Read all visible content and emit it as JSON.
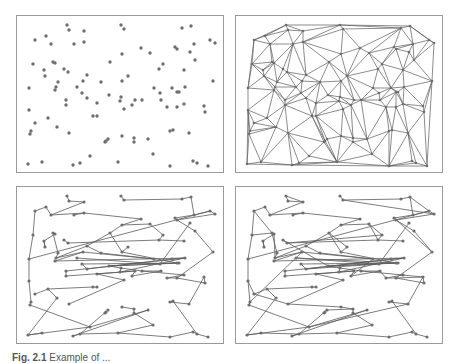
{
  "figure": {
    "caption_label": "Fig. 2.1",
    "caption_text": "Example of ...",
    "dot_color": "#6e6e6e",
    "edge_color": "#5a5a5a",
    "border_color": "#9a9a9a"
  },
  "panels": [
    {
      "id": "points",
      "title": "Random point set"
    },
    {
      "id": "delaunay",
      "title": "Delaunay triangulation"
    },
    {
      "id": "mst",
      "title": "Minimum spanning tree"
    },
    {
      "id": "graph",
      "title": "Sparse proximity graph"
    }
  ],
  "points": [
    [
      50,
      9
    ],
    [
      52,
      14
    ],
    [
      104,
      9
    ],
    [
      107,
      13
    ],
    [
      67,
      15
    ],
    [
      165,
      12
    ],
    [
      174,
      10
    ],
    [
      18,
      24
    ],
    [
      29,
      20
    ],
    [
      34,
      28
    ],
    [
      57,
      28
    ],
    [
      67,
      26
    ],
    [
      193,
      24
    ],
    [
      198,
      27
    ],
    [
      105,
      38
    ],
    [
      124,
      32
    ],
    [
      133,
      37
    ],
    [
      158,
      31
    ],
    [
      160,
      33
    ],
    [
      177,
      28
    ],
    [
      173,
      36
    ],
    [
      16,
      48
    ],
    [
      36,
      46
    ],
    [
      38,
      47
    ],
    [
      27,
      54
    ],
    [
      28,
      60
    ],
    [
      47,
      53
    ],
    [
      51,
      56
    ],
    [
      178,
      44
    ],
    [
      146,
      48
    ],
    [
      142,
      53
    ],
    [
      167,
      54
    ],
    [
      93,
      46
    ],
    [
      70,
      59
    ],
    [
      12,
      72
    ],
    [
      41,
      66
    ],
    [
      39,
      71
    ],
    [
      38,
      74
    ],
    [
      66,
      65
    ],
    [
      60,
      71
    ],
    [
      105,
      65
    ],
    [
      111,
      60
    ],
    [
      84,
      66
    ],
    [
      196,
      65
    ],
    [
      137,
      72
    ],
    [
      143,
      77
    ],
    [
      168,
      71
    ],
    [
      155,
      72
    ],
    [
      160,
      76
    ],
    [
      162,
      76
    ],
    [
      92,
      79
    ],
    [
      65,
      77
    ],
    [
      70,
      82
    ],
    [
      104,
      81
    ],
    [
      103,
      85
    ],
    [
      49,
      84
    ],
    [
      49,
      89
    ],
    [
      144,
      84
    ],
    [
      80,
      87
    ],
    [
      118,
      84
    ],
    [
      115,
      89
    ],
    [
      125,
      84
    ],
    [
      107,
      93
    ],
    [
      167,
      88
    ],
    [
      150,
      91
    ],
    [
      160,
      91
    ],
    [
      187,
      90
    ],
    [
      188,
      96
    ],
    [
      12,
      94
    ],
    [
      76,
      100
    ],
    [
      80,
      100
    ],
    [
      31,
      102
    ],
    [
      18,
      107
    ],
    [
      40,
      111
    ],
    [
      14,
      115
    ],
    [
      13,
      118
    ],
    [
      52,
      117
    ],
    [
      153,
      115
    ],
    [
      156,
      114
    ],
    [
      172,
      117
    ],
    [
      89,
      125
    ],
    [
      88,
      126
    ],
    [
      91,
      123
    ],
    [
      105,
      120
    ],
    [
      117,
      122
    ],
    [
      117,
      126
    ],
    [
      131,
      123
    ],
    [
      136,
      138
    ],
    [
      73,
      140
    ],
    [
      11,
      148
    ],
    [
      25,
      146
    ],
    [
      56,
      149
    ],
    [
      63,
      147
    ],
    [
      101,
      146
    ],
    [
      153,
      150
    ],
    [
      176,
      145
    ],
    [
      180,
      147
    ],
    [
      191,
      150
    ]
  ],
  "mst_edges": [
    [
      0,
      1
    ],
    [
      1,
      4
    ],
    [
      4,
      9
    ],
    [
      9,
      8
    ],
    [
      8,
      7
    ],
    [
      7,
      21
    ],
    [
      9,
      11
    ],
    [
      11,
      15
    ],
    [
      15,
      14
    ],
    [
      14,
      16
    ],
    [
      14,
      32
    ],
    [
      32,
      33
    ],
    [
      33,
      36
    ],
    [
      36,
      35
    ],
    [
      35,
      22
    ],
    [
      22,
      23
    ],
    [
      23,
      24
    ],
    [
      24,
      25
    ],
    [
      21,
      34
    ],
    [
      34,
      12
    ],
    [
      2,
      3
    ],
    [
      3,
      5
    ],
    [
      5,
      6
    ],
    [
      6,
      19
    ],
    [
      19,
      12
    ],
    [
      12,
      13
    ],
    [
      13,
      18
    ],
    [
      18,
      17
    ],
    [
      17,
      19
    ],
    [
      18,
      28
    ],
    [
      28,
      43
    ],
    [
      43,
      65
    ],
    [
      16,
      29
    ],
    [
      29,
      30
    ],
    [
      30,
      31
    ],
    [
      30,
      27
    ],
    [
      27,
      26
    ],
    [
      32,
      40
    ],
    [
      40,
      41
    ],
    [
      40,
      48
    ],
    [
      48,
      50
    ],
    [
      50,
      53
    ],
    [
      53,
      54
    ],
    [
      53,
      61
    ],
    [
      61,
      63
    ],
    [
      61,
      57
    ],
    [
      57,
      60
    ],
    [
      60,
      59
    ],
    [
      59,
      58
    ],
    [
      58,
      62
    ],
    [
      62,
      76
    ],
    [
      36,
      38
    ],
    [
      38,
      37
    ],
    [
      37,
      46
    ],
    [
      46,
      47
    ],
    [
      46,
      54
    ],
    [
      46,
      55
    ],
    [
      55,
      56
    ],
    [
      47,
      52
    ],
    [
      52,
      51
    ],
    [
      51,
      49
    ],
    [
      49,
      50
    ],
    [
      38,
      44
    ],
    [
      44,
      42
    ],
    [
      42,
      33
    ],
    [
      25,
      24
    ],
    [
      34,
      68
    ],
    [
      68,
      74
    ],
    [
      74,
      75
    ],
    [
      75,
      88
    ],
    [
      88,
      89
    ],
    [
      89,
      90
    ],
    [
      89,
      73
    ],
    [
      73,
      71
    ],
    [
      71,
      69
    ],
    [
      69,
      70
    ],
    [
      72,
      71
    ],
    [
      88,
      86
    ],
    [
      86,
      91
    ],
    [
      91,
      92
    ],
    [
      92,
      93
    ],
    [
      93,
      94
    ],
    [
      94,
      95
    ],
    [
      95,
      96
    ],
    [
      96,
      97
    ],
    [
      96,
      78
    ],
    [
      78,
      77
    ],
    [
      77,
      79
    ],
    [
      79,
      66
    ],
    [
      66,
      67
    ],
    [
      67,
      65
    ],
    [
      65,
      64
    ],
    [
      64,
      63
    ],
    [
      83,
      84
    ],
    [
      84,
      85
    ],
    [
      85,
      87
    ],
    [
      87,
      93
    ],
    [
      80,
      81
    ],
    [
      81,
      82
    ],
    [
      82,
      92
    ],
    [
      39,
      45
    ],
    [
      45,
      20
    ],
    [
      10,
      11
    ],
    [
      56,
      59
    ]
  ],
  "graph_extra_edges": [
    [
      0,
      4
    ],
    [
      3,
      13
    ],
    [
      7,
      22
    ],
    [
      21,
      22
    ],
    [
      23,
      36
    ],
    [
      29,
      27
    ],
    [
      26,
      50
    ],
    [
      41,
      32
    ],
    [
      16,
      30
    ],
    [
      57,
      64
    ],
    [
      63,
      66
    ],
    [
      60,
      44
    ],
    [
      76,
      83
    ],
    [
      72,
      76
    ],
    [
      68,
      72
    ],
    [
      90,
      92
    ],
    [
      84,
      82
    ],
    [
      65,
      66
    ],
    [
      17,
      43
    ],
    [
      12,
      6
    ],
    [
      45,
      52
    ],
    [
      74,
      38
    ],
    [
      49,
      39
    ],
    [
      88,
      79
    ]
  ]
}
